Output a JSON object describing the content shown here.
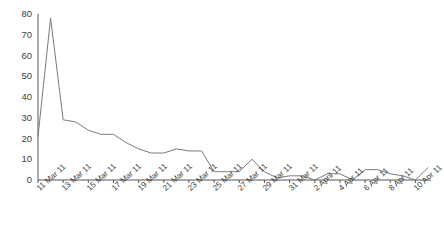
{
  "chart_data": {
    "type": "line",
    "title": "",
    "subtitle": "",
    "xlabel": "",
    "ylabel": "",
    "ylim": [
      0,
      80
    ],
    "yticks": [
      0,
      10,
      20,
      30,
      40,
      50,
      60,
      70,
      80
    ],
    "grid": false,
    "legend": "none",
    "line_color": "#7a7a7a",
    "axis_color": "#555555",
    "x": [
      "11 Mar 11",
      "12 Mar 11",
      "13 Mar 11",
      "14 Mar 11",
      "15 Mar 11",
      "16 Mar 11",
      "17 Mar 11",
      "18 Mar 11",
      "19 Mar 11",
      "20 Mar 11",
      "21 Mar 11",
      "22 Mar 11",
      "23 Mar 11",
      "24 Mar 11",
      "25 Mar 11",
      "26 Mar 11",
      "27 Mar 11",
      "28 Mar 11",
      "29 Mar 11",
      "30 Mar 11",
      "31 Mar 11",
      "1 April 11",
      "2 April 11",
      "3 Apr 11",
      "4 Apr 11",
      "5 Apr 11",
      "6 Apr 11",
      "7 Apr 11",
      "8 Apr 11",
      "9 Apr 11",
      "10 Apr 11",
      "11 Apr 11"
    ],
    "values": [
      21,
      78,
      29,
      28,
      24,
      22,
      22,
      18,
      15,
      13,
      13,
      15,
      14,
      14,
      4,
      4,
      4,
      10,
      4,
      1,
      2,
      2,
      0,
      3,
      3,
      0,
      5,
      5,
      3,
      2,
      0,
      6
    ],
    "xtick_labels": [
      "11 Mar 11",
      "13 Mar 11",
      "15 Mar 11",
      "17 Mar 11",
      "19 Mar 11",
      "21 Mar 11",
      "23 Mar 11",
      "25 Mar 11",
      "27 Mar 11",
      "29 Mar 11",
      "31 Mar 11",
      "2 April 11",
      "4 Apr 11",
      "6 Apr 11",
      "8 Apr 11",
      "10 Apr 11"
    ],
    "xtick_indices": [
      0,
      2,
      4,
      6,
      8,
      10,
      12,
      14,
      16,
      18,
      20,
      22,
      24,
      26,
      28,
      30
    ]
  }
}
